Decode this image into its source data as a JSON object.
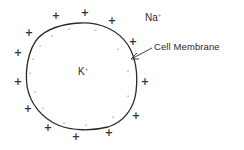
{
  "figure": {
    "labels": {
      "outside_ion": "Na",
      "outside_ion_charge": "+",
      "inside_ion": "K",
      "inside_ion_charge": "+",
      "membrane": "Cell Membrane"
    },
    "charges": {
      "outside_symbol": "+",
      "inside_symbol": "-",
      "outside_positions": [
        [
          56,
          16
        ],
        [
          85,
          13
        ],
        [
          112,
          21
        ],
        [
          29,
          33
        ],
        [
          18,
          53
        ],
        [
          18,
          82
        ],
        [
          28,
          109
        ],
        [
          48,
          128
        ],
        [
          76,
          137
        ],
        [
          109,
          133
        ],
        [
          136,
          116
        ],
        [
          145,
          82
        ],
        [
          133,
          42
        ]
      ],
      "inside_positions": [
        [
          69,
          29
        ],
        [
          95,
          30
        ],
        [
          52,
          36
        ],
        [
          40,
          46
        ],
        [
          33,
          59
        ],
        [
          30,
          73
        ],
        [
          35,
          92
        ],
        [
          43,
          108
        ],
        [
          64,
          123
        ],
        [
          86,
          125
        ],
        [
          113,
          117
        ],
        [
          128,
          96
        ],
        [
          128,
          71
        ],
        [
          118,
          49
        ]
      ]
    },
    "colors": {
      "line": "#2a2a2a",
      "background": "#ffffff"
    }
  }
}
